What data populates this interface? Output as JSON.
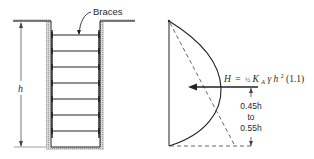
{
  "figure": {
    "left_panel": {
      "title": "Braced excavation",
      "callout_label": "Braces",
      "dimension_label": "h",
      "brace_count": 7
    },
    "right_panel": {
      "title": "Pressure distribution",
      "force_equation": {
        "lhs": "H",
        "equals": "=",
        "fraction": "½",
        "coef": "K",
        "coef_sub": "A",
        "gamma": "γ",
        "var": "h",
        "exp": "2",
        "factor": "(1.1)"
      },
      "location_label": {
        "line1": "0.45h",
        "line2": "to",
        "line3": "0.55h"
      }
    },
    "colors": {
      "line": "#222222",
      "soil_hatch": "#9a9a9a",
      "dashed": "#555555"
    }
  }
}
